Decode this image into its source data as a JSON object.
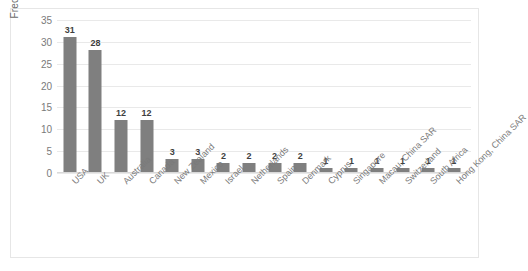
{
  "chart_data": {
    "type": "bar",
    "title": "",
    "xlabel": "",
    "ylabel": "Frequency",
    "categories": [
      "USA",
      "UK",
      "Australia",
      "Canada",
      "New Zealand",
      "Mexico",
      "Israel",
      "Netherlands",
      "Spain",
      "Denmark",
      "Cyprus",
      "Singapore",
      "Macau, China SAR",
      "Switzerland",
      "South Africa",
      "Hong Kong, China SAR"
    ],
    "values": [
      31,
      28,
      12,
      12,
      3,
      3,
      2,
      2,
      2,
      2,
      1,
      1,
      1,
      1,
      1,
      1
    ],
    "ylim": [
      0,
      35
    ],
    "yticks": [
      0,
      5,
      10,
      15,
      20,
      25,
      30,
      35
    ],
    "grid": true,
    "legend": false,
    "bar_color": "#7f7f7f",
    "data_labels": true
  }
}
